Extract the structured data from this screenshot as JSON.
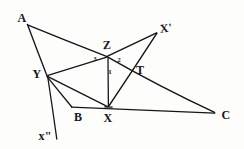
{
  "figure": {
    "kind": "hand-drawn-geometry-diagram",
    "canvas": {
      "width": 244,
      "height": 149
    },
    "ink_color": "#15161a",
    "paper_color": "#fdfdfc",
    "points": {
      "A": {
        "label": "A",
        "x": 27,
        "y": 24
      },
      "Xp": {
        "label": "X'",
        "x": 157,
        "y": 33
      },
      "Z": {
        "label": "Z",
        "x": 108,
        "y": 57
      },
      "Y": {
        "label": "Y",
        "x": 47,
        "y": 76
      },
      "T": {
        "label": "T",
        "x": 134,
        "y": 74
      },
      "B": {
        "label": "B",
        "x": 72,
        "y": 107
      },
      "X": {
        "label": "X",
        "x": 108,
        "y": 107
      },
      "C": {
        "label": "C",
        "x": 215,
        "y": 113
      },
      "Xpp": {
        "label": "x\"",
        "x": 45,
        "y": 136
      }
    },
    "angle_labels": [
      {
        "name": "angle-1",
        "text": "1",
        "x": 110,
        "y": 72
      },
      {
        "name": "angle-2",
        "text": "2",
        "x": 119,
        "y": 60
      },
      {
        "name": "angle-3",
        "text": "3",
        "x": 95,
        "y": 59
      }
    ],
    "segments": [
      {
        "name": "segment-A-Y",
        "from": "A",
        "to": "Y"
      },
      {
        "name": "segment-A-T-C",
        "from": "A",
        "to": "C"
      },
      {
        "name": "segment-Y-Z",
        "from": "Y",
        "to": "Z"
      },
      {
        "name": "segment-Z-Xprime",
        "from": "Z",
        "to": "Xp"
      },
      {
        "name": "segment-Xprime-X",
        "from": "Xp",
        "to": "X"
      },
      {
        "name": "segment-Z-X",
        "from": "Z",
        "to": "X"
      },
      {
        "name": "segment-Y-X",
        "from": "Y",
        "to": "X"
      },
      {
        "name": "segment-Y-B",
        "from": "Y",
        "to": "B"
      },
      {
        "name": "segment-B-C",
        "from": "B",
        "to": "C"
      },
      {
        "name": "segment-Y-xdouble",
        "from": "Y",
        "to": "Xpp"
      }
    ]
  }
}
